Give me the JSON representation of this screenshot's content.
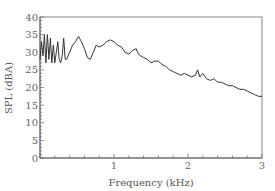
{
  "chart_data": {
    "type": "line",
    "title": "",
    "xlabel": "Frequency (kHz)",
    "ylabel": "SPL (dBA)",
    "xlim": [
      0,
      3
    ],
    "ylim": [
      0,
      40
    ],
    "x_ticks": [
      1,
      2,
      3
    ],
    "x_tick_labels": [
      "1",
      "2",
      "3"
    ],
    "y_ticks": [
      0,
      5,
      10,
      15,
      20,
      25,
      30,
      35,
      40
    ],
    "y_tick_labels": [
      "0",
      "5",
      "10",
      "15",
      "20",
      "25",
      "30",
      "35",
      "40"
    ],
    "grid": false,
    "legend": null,
    "series": [
      {
        "name": "SPL",
        "color": "#333333",
        "x": [
          0.0,
          0.02,
          0.04,
          0.06,
          0.08,
          0.1,
          0.12,
          0.14,
          0.16,
          0.18,
          0.2,
          0.22,
          0.24,
          0.26,
          0.28,
          0.3,
          0.32,
          0.34,
          0.36,
          0.38,
          0.4,
          0.44,
          0.48,
          0.52,
          0.56,
          0.6,
          0.64,
          0.68,
          0.72,
          0.76,
          0.8,
          0.85,
          0.9,
          0.95,
          1.0,
          1.05,
          1.1,
          1.15,
          1.2,
          1.25,
          1.3,
          1.33,
          1.36,
          1.4,
          1.45,
          1.5,
          1.55,
          1.6,
          1.65,
          1.7,
          1.75,
          1.8,
          1.85,
          1.9,
          1.95,
          2.0,
          2.05,
          2.1,
          2.13,
          2.16,
          2.2,
          2.25,
          2.3,
          2.35,
          2.4,
          2.45,
          2.5,
          2.55,
          2.6,
          2.65,
          2.7,
          2.75,
          2.8,
          2.85,
          2.9,
          2.95,
          3.0
        ],
        "values": [
          28,
          33,
          29,
          35,
          27,
          35,
          28,
          34,
          27,
          32,
          27,
          30,
          33,
          28,
          27,
          29,
          34,
          28,
          28,
          29,
          30,
          32,
          33,
          34.5,
          33,
          31,
          28.5,
          28,
          30,
          32,
          31.5,
          32,
          33,
          33.5,
          33,
          32,
          31.5,
          30,
          29.5,
          30.5,
          31,
          29.5,
          29,
          28.5,
          28,
          27,
          27.5,
          27.5,
          26.5,
          26,
          25,
          24.5,
          24,
          23.5,
          24,
          23.5,
          23,
          23.5,
          25,
          23,
          24,
          22.5,
          22,
          22.5,
          21.5,
          21.5,
          21,
          20.5,
          20.5,
          20,
          19.5,
          19.5,
          19,
          18.5,
          18,
          17.5,
          17.5
        ]
      }
    ]
  },
  "labels": {
    "xlabel": "Frequency (kHz)",
    "ylabel": "SPL (dBA)"
  }
}
